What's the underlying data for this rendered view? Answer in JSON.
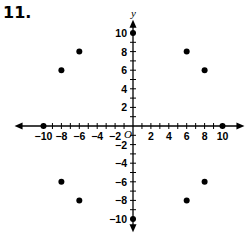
{
  "problem_number": "11.",
  "colors": {
    "axis": "#000000",
    "point": "#000000",
    "background": "#ffffff"
  },
  "chart_data": {
    "type": "scatter",
    "title": "",
    "xlabel": "x",
    "ylabel": "y",
    "origin_label": "O",
    "xlim": [
      -11,
      11
    ],
    "ylim": [
      -11,
      11
    ],
    "grid": false,
    "x_tick_labels": [
      "-10",
      "-8",
      "-6",
      "-4",
      "-2",
      "2",
      "4",
      "6",
      "8",
      "10"
    ],
    "y_tick_labels": [
      "10",
      "8",
      "6",
      "4",
      "2",
      "-2",
      "-4",
      "-6",
      "-8",
      "-10"
    ],
    "points": [
      {
        "x": 0,
        "y": 10
      },
      {
        "x": 0,
        "y": -10
      },
      {
        "x": -10,
        "y": 0
      },
      {
        "x": 10,
        "y": 0
      },
      {
        "x": 6,
        "y": 8
      },
      {
        "x": 8,
        "y": 6
      },
      {
        "x": -6,
        "y": 8
      },
      {
        "x": -8,
        "y": 6
      },
      {
        "x": -8,
        "y": -6
      },
      {
        "x": -6,
        "y": -8
      },
      {
        "x": 6,
        "y": -8
      },
      {
        "x": 8,
        "y": -6
      }
    ]
  }
}
